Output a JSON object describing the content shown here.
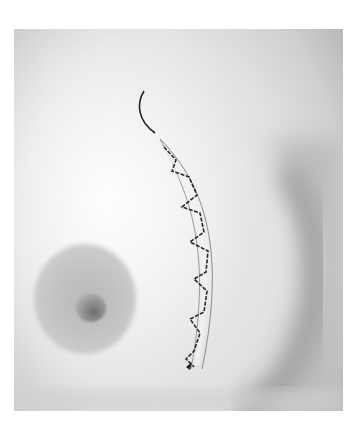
{
  "image": {
    "subject": "clinical photograph of curved skin incision with zigzag suture line",
    "palette": {
      "background": "#ffffff",
      "skin_light": "#ececec",
      "skin_shadow": "#9a9a9a",
      "areola": "#bcbcbc",
      "suture": "#2a2a2a"
    }
  }
}
